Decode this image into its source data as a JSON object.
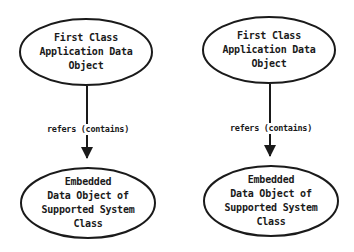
{
  "diagrams": [
    {
      "source": {
        "lines": [
          "First Class",
          "Application Data",
          "Object"
        ]
      },
      "edge": {
        "label": "refers (contains)"
      },
      "target": {
        "lines": [
          "Embedded",
          "Data Object of",
          "Supported System",
          "Class"
        ]
      }
    },
    {
      "source": {
        "lines": [
          "First Class",
          "Application Data",
          "Object"
        ]
      },
      "edge": {
        "label": "refers (contains)"
      },
      "target": {
        "lines": [
          "Embedded",
          "Data Object of",
          "Supported System",
          "Class"
        ]
      }
    }
  ],
  "colors": {
    "stroke": "#1a1a1a",
    "background": "#ffffff"
  }
}
